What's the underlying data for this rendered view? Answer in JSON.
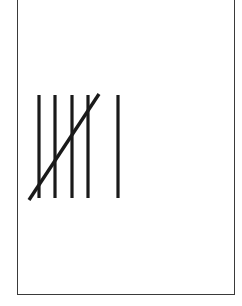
{
  "diagram": {
    "type": "tally-marks",
    "count": 6,
    "groups": [
      {
        "strokes": 5,
        "crossed": true
      },
      {
        "strokes": 1,
        "crossed": false
      }
    ],
    "label": "6",
    "stroke_color": "#1a1a1a",
    "border_color": "#3a3a3a",
    "background_color": "#ffffff",
    "strokes": [
      {
        "x": 39,
        "y1": 95,
        "y2": 198
      },
      {
        "x": 55,
        "y1": 95,
        "y2": 198
      },
      {
        "x": 72,
        "y1": 95,
        "y2": 198
      },
      {
        "x": 88,
        "y1": 95,
        "y2": 198
      },
      {
        "x": 118,
        "y1": 95,
        "y2": 198
      }
    ],
    "cross_stroke": {
      "x1": 29,
      "y1": 200,
      "x2": 99,
      "y2": 94
    }
  }
}
